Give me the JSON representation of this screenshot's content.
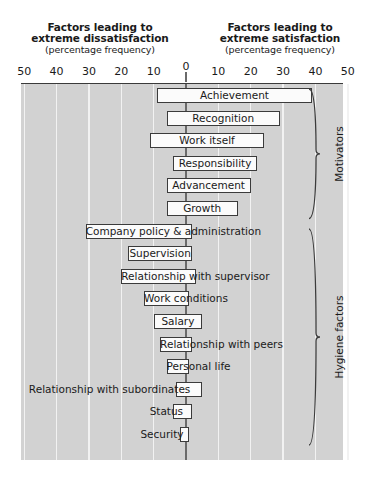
{
  "header": {
    "left": {
      "line1": "Factors leading to",
      "line2": "extreme dissatisfaction",
      "line3": "(percentage frequency)"
    },
    "right": {
      "line1": "Factors leading to",
      "line2": "extreme satisfaction",
      "line3": "(percentage frequency)"
    }
  },
  "axis": {
    "tick_labels": [
      "50",
      "40",
      "30",
      "20",
      "10",
      "0",
      "10",
      "20",
      "30",
      "40",
      "50"
    ],
    "tick_values": [
      -50,
      -40,
      -30,
      -20,
      -10,
      0,
      10,
      20,
      30,
      40,
      50
    ]
  },
  "groups": [
    {
      "name": "Motivators",
      "label": "Motivators"
    },
    {
      "name": "Hygiene factors",
      "label": "Hygiene factors"
    }
  ],
  "chart_data": {
    "type": "bar",
    "orientation": "horizontal",
    "xlabel": "percentage frequency",
    "ylabel": "",
    "xlim": [
      -50,
      50
    ],
    "grid": true,
    "legend": "none",
    "annotations": [
      "Factors leading to extreme dissatisfaction (percentage frequency)",
      "Factors leading to extreme satisfaction (percentage frequency)",
      "Motivators",
      "Hygiene factors"
    ],
    "categories": [
      "Achievement",
      "Recognition",
      "Work itself",
      "Responsibility",
      "Advancement",
      "Growth",
      "Company policy & administration",
      "Supervision",
      "Relationship with supervisor",
      "Work conditions",
      "Salary",
      "Relationship with peers",
      "Personal life",
      "Relationship with subordinates",
      "Status",
      "Security"
    ],
    "series": [
      {
        "name": "Dissatisfaction (negative %)",
        "values": [
          -9,
          -6,
          -11,
          -6,
          -6,
          -6,
          -31,
          -18,
          -20,
          -13,
          -10,
          -8,
          -6,
          -3,
          -4,
          -2
        ]
      },
      {
        "name": "Satisfaction (positive %)",
        "values": [
          39,
          29,
          24,
          22,
          20,
          16,
          2,
          2,
          3,
          1,
          5,
          2,
          1,
          5,
          2,
          1
        ]
      }
    ],
    "bars": [
      {
        "label": "Achievement",
        "start": -9,
        "end": 39,
        "group": "Motivators",
        "label_pos": "inside"
      },
      {
        "label": "Recognition",
        "start": -6,
        "end": 29,
        "group": "Motivators",
        "label_pos": "inside"
      },
      {
        "label": "Work itself",
        "start": -11,
        "end": 24,
        "group": "Motivators",
        "label_pos": "inside"
      },
      {
        "label": "Responsibility",
        "start": -4,
        "end": 22,
        "group": "Motivators",
        "label_pos": "inside"
      },
      {
        "label": "Advancement",
        "start": -6,
        "end": 20,
        "group": "Motivators",
        "label_pos": "inside"
      },
      {
        "label": "Growth",
        "start": -6,
        "end": 16,
        "group": "Motivators",
        "label_pos": "inside"
      },
      {
        "label": "Company policy & administration",
        "start": -31,
        "end": 2,
        "group": "Hygiene factors",
        "label_pos": "inside"
      },
      {
        "label": "Supervision",
        "start": -18,
        "end": 2,
        "group": "Hygiene factors",
        "label_pos": "inside"
      },
      {
        "label": "Relationship with supervisor",
        "start": -20,
        "end": 3,
        "group": "Hygiene factors",
        "label_pos": "inside"
      },
      {
        "label": "Work conditions",
        "start": -13,
        "end": 1,
        "group": "Hygiene factors",
        "label_pos": "inside"
      },
      {
        "label": "Salary",
        "start": -10,
        "end": 5,
        "group": "Hygiene factors",
        "label_pos": "inside"
      },
      {
        "label": "Relationship with peers",
        "start": -8,
        "end": 2,
        "group": "Hygiene factors",
        "label_pos": "inside"
      },
      {
        "label": "Personal life",
        "start": -6,
        "end": 1,
        "group": "Hygiene factors",
        "label_pos": "inside"
      },
      {
        "label": "Relationship with subordinates",
        "start": -3,
        "end": 5,
        "group": "Hygiene factors",
        "label_pos": "outside"
      },
      {
        "label": "Status",
        "start": -4,
        "end": 2,
        "group": "Hygiene factors",
        "label_pos": "outside"
      },
      {
        "label": "Security",
        "start": -2,
        "end": 1,
        "group": "Hygiene factors",
        "label_pos": "outside"
      }
    ]
  },
  "colors": {
    "plot_background": "#d2d2d2",
    "gridline": "#f2f2f2",
    "bar_fill": "#fbfbfb",
    "bar_border": "#3b3b3b",
    "axis": "#6a6a6a",
    "text": "#1a1a1a"
  }
}
